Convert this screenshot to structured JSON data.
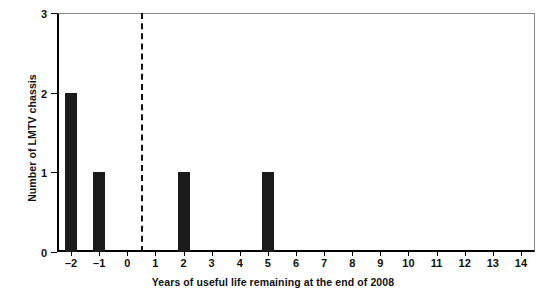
{
  "chart_data": {
    "type": "bar",
    "title": "",
    "xlabel": "Years of useful life remaining at the end of 2008",
    "ylabel": "Number of LMTV chassis",
    "categories": [
      "-2",
      "-1",
      "0",
      "1",
      "2",
      "3",
      "4",
      "5",
      "6",
      "7",
      "8",
      "9",
      "10",
      "11",
      "12",
      "13",
      "14"
    ],
    "values": [
      2,
      1,
      0,
      0,
      1,
      0,
      0,
      1,
      0,
      0,
      0,
      0,
      0,
      0,
      0,
      0,
      0
    ],
    "x_tick_labels": [
      "–2",
      "–1",
      "0",
      "1",
      "2",
      "3",
      "4",
      "5",
      "6",
      "7",
      "8",
      "9",
      "10",
      "11",
      "12",
      "13",
      "14"
    ],
    "y_tick_labels": [
      "0",
      "1",
      "2",
      "3"
    ],
    "y_ticks": [
      0,
      1,
      2,
      3
    ],
    "xlim": [
      -2.5,
      14.5
    ],
    "ylim": [
      0,
      3
    ],
    "grid": false,
    "legend": false,
    "bar_color": "#1b1b1b",
    "annotations": [
      {
        "name": "reference-line",
        "type": "vertical-dashed-line",
        "x": 0.5,
        "color": "#111111"
      }
    ]
  }
}
